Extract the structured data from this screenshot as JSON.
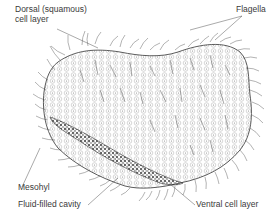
{
  "diagram": {
    "labels": {
      "dorsal_line1": "Dorsal (squamous)",
      "dorsal_line2": "cell layer",
      "flagella": "Flagella",
      "mesohyl": "Mesohyl",
      "fluid_cavity": "Fluid-filled cavity",
      "ventral": "Ventral cell layer"
    },
    "colors": {
      "text": "#3a3a3a",
      "outline": "#333333",
      "cell": "#8a8a8a",
      "hair": "#555555",
      "cavity": "#4a4a4a",
      "background": "#ffffff"
    }
  }
}
